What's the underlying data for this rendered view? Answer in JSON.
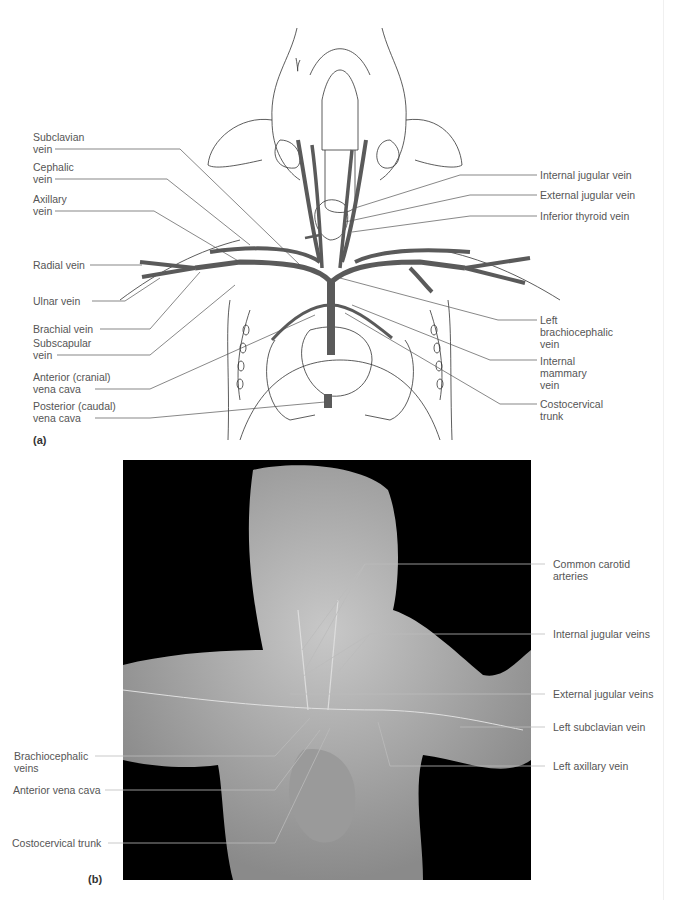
{
  "figure": {
    "panel_a": {
      "letter": "(a)",
      "left_labels": [
        {
          "line1": "Subclavian",
          "line2": "vein"
        },
        {
          "line1": "Cephalic",
          "line2": "vein"
        },
        {
          "line1": "Axillary",
          "line2": "vein"
        },
        {
          "line1": "Radial vein"
        },
        {
          "line1": "Ulnar vein"
        },
        {
          "line1": "Brachial vein"
        },
        {
          "line1": "Subscapular",
          "line2": "vein"
        },
        {
          "line1": "Anterior (cranial)",
          "line2": "vena cava"
        },
        {
          "line1": "Posterior (caudal)",
          "line2": "vena cava"
        }
      ],
      "right_labels": [
        {
          "line1": "Internal jugular vein"
        },
        {
          "line1": "External jugular vein"
        },
        {
          "line1": "Inferior thyroid vein"
        },
        {
          "line1": "Left",
          "line2": "brachiocephalic",
          "line3": "vein"
        },
        {
          "line1": "Internal",
          "line2": "mammary",
          "line3": "vein"
        },
        {
          "line1": "Costocervical",
          "line2": "trunk"
        }
      ],
      "vein_color": "#5a5a5a"
    },
    "panel_b": {
      "letter": "(b)",
      "left_labels": [
        {
          "line1": "Brachiocephalic",
          "line2": "veins"
        },
        {
          "line1": "Anterior vena cava"
        },
        {
          "line1": "Costocervical trunk"
        }
      ],
      "right_labels": [
        {
          "line1": "Common carotid",
          "line2": "arteries"
        },
        {
          "line1": "Internal jugular veins"
        },
        {
          "line1": "External jugular veins"
        },
        {
          "line1": "Left subclavian vein"
        },
        {
          "line1": "Left axillary vein"
        }
      ]
    }
  }
}
